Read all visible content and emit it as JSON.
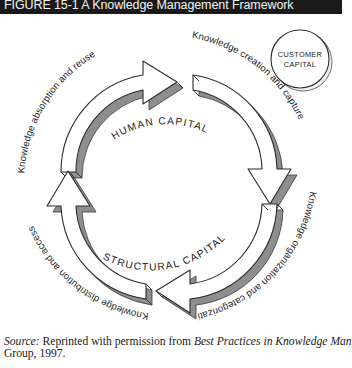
{
  "figure": {
    "title": "FIGURE 15-1  A Knowledge Management Framework",
    "title_bar_color": "#1a1a1a",
    "title_text_color": "#f2f2f2"
  },
  "diagram": {
    "type": "cycle-diagram",
    "arrow_fill": "#ffffff",
    "arrow_edge_color": "#2b2b2b",
    "arrow_shade_color": "#8e8e8e",
    "arrows": [
      {
        "id": "knowledge-creation-and-capture",
        "label": "Knowledge creation and capture",
        "position": "top-right"
      },
      {
        "id": "knowledge-organization-and-categorization",
        "label": "Knowledge organization and categorization",
        "position": "bottom-right"
      },
      {
        "id": "knowledge-distribution-and-access",
        "label": "Knowledge distribution and access",
        "position": "bottom-left"
      },
      {
        "id": "knowledge-absorption-and-reuse",
        "label": "Knowledge absorption and reuse",
        "position": "top-left"
      }
    ],
    "center_labels": [
      {
        "id": "human-capital",
        "label": "HUMAN CAPITAL"
      },
      {
        "id": "structural-capital",
        "label": "STRUCTURAL CAPITAL"
      }
    ],
    "badge": {
      "id": "customer-capital",
      "line1": "CUSTOMER",
      "line2": "CAPITAL",
      "shape": "circle"
    }
  },
  "source": {
    "label": "Source:",
    "line1_part1": " Reprinted with permission from ",
    "line1_title": "Best Practices in Knowledge Man",
    "line2": "Group, 1997."
  }
}
